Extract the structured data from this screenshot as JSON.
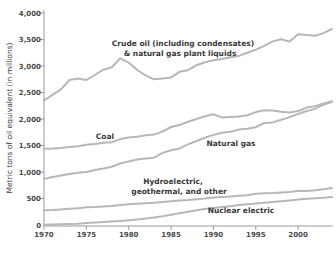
{
  "chart_data": {
    "type": "line",
    "title": "",
    "xlabel": "",
    "ylabel": "Metric tons of oil equivalent (in millions)",
    "ylim": [
      0,
      4000
    ],
    "ytick_interval": 500,
    "ytick_labels": [
      "4,000",
      "3,500",
      "3,000",
      "2,500",
      "2,000",
      "1,500",
      "1,000",
      "500",
      "0"
    ],
    "xtick_labels": [
      "1970",
      "1975",
      "1980",
      "1985",
      "1990",
      "1995",
      "2000"
    ],
    "grid": false,
    "legend": "inline-labels",
    "x": [
      1970,
      1971,
      1972,
      1973,
      1974,
      1975,
      1976,
      1977,
      1978,
      1979,
      1980,
      1981,
      1982,
      1983,
      1984,
      1985,
      1986,
      1987,
      1988,
      1989,
      1990,
      1991,
      1992,
      1993,
      1994,
      1995,
      1996,
      1997,
      1998,
      1999,
      2000,
      2001,
      2002,
      2003,
      2004
    ],
    "series": [
      {
        "name": "Crude oil (including condensates) & natural gas plant liquids",
        "label_lines": [
          "Crude oil (including condensates)",
          "& natural gas plant liquids"
        ],
        "values": [
          2350,
          2455,
          2560,
          2735,
          2765,
          2735,
          2830,
          2930,
          2975,
          3145,
          3065,
          2925,
          2825,
          2750,
          2765,
          2785,
          2890,
          2920,
          3015,
          3070,
          3110,
          3130,
          3165,
          3190,
          3250,
          3310,
          3380,
          3465,
          3505,
          3460,
          3600,
          3585,
          3570,
          3620,
          3700
        ]
      },
      {
        "name": "Coal",
        "label_lines": [
          "Coal"
        ],
        "values": [
          1440,
          1445,
          1455,
          1470,
          1485,
          1515,
          1530,
          1550,
          1560,
          1620,
          1650,
          1665,
          1695,
          1705,
          1765,
          1850,
          1885,
          1950,
          2000,
          2050,
          2090,
          2030,
          2040,
          2045,
          2070,
          2130,
          2165,
          2160,
          2135,
          2120,
          2150,
          2215,
          2240,
          2295,
          2335
        ]
      },
      {
        "name": "Natural gas",
        "label_lines": [
          "Natural gas"
        ],
        "values": [
          870,
          905,
          935,
          965,
          985,
          1000,
          1035,
          1065,
          1100,
          1160,
          1200,
          1235,
          1255,
          1270,
          1360,
          1410,
          1445,
          1520,
          1585,
          1645,
          1700,
          1740,
          1760,
          1800,
          1815,
          1845,
          1925,
          1935,
          1985,
          2035,
          2095,
          2150,
          2190,
          2270,
          2325
        ]
      },
      {
        "name": "Hydroelectric, geothermal, and other",
        "label_lines": [
          "Hydroelectric,",
          "geothermal, and other"
        ],
        "values": [
          280,
          285,
          295,
          305,
          315,
          335,
          340,
          350,
          360,
          375,
          390,
          400,
          410,
          420,
          435,
          450,
          460,
          470,
          485,
          500,
          520,
          530,
          535,
          550,
          560,
          590,
          600,
          605,
          615,
          625,
          645,
          640,
          655,
          675,
          700
        ]
      },
      {
        "name": "Nuclear electric",
        "label_lines": [
          "Nuclear electric"
        ],
        "values": [
          5,
          10,
          15,
          20,
          25,
          35,
          45,
          55,
          65,
          75,
          90,
          105,
          120,
          140,
          165,
          195,
          220,
          250,
          280,
          300,
          320,
          340,
          355,
          375,
          390,
          405,
          420,
          435,
          450,
          465,
          480,
          495,
          505,
          515,
          530
        ]
      }
    ],
    "style": {
      "line_color": "#b7b7b7",
      "axis_color": "#9a9a9a",
      "tick_text_color": "#4a4a4a",
      "label_color": "#383838",
      "background": "#ffffff"
    }
  }
}
